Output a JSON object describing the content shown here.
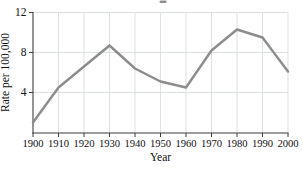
{
  "chart_data": {
    "type": "line",
    "title": "",
    "xlabel": "Year",
    "ylabel": "Rate per 100,000",
    "x": [
      1900,
      1910,
      1920,
      1930,
      1940,
      1950,
      1960,
      1970,
      1980,
      1990,
      2000
    ],
    "values": [
      1.0,
      4.5,
      6.6,
      8.7,
      6.4,
      5.1,
      4.5,
      8.2,
      10.3,
      9.5,
      6.1
    ],
    "xticks": [
      "1900",
      "1910",
      "1920",
      "1930",
      "1940",
      "1950",
      "1960",
      "1970",
      "1980",
      "1990",
      "2000"
    ],
    "yticks": [
      4,
      8,
      12
    ],
    "ylim": [
      0,
      12
    ],
    "xlim": [
      1900,
      2000
    ],
    "grid": true,
    "legend": false,
    "colors": {
      "line": "#8c8c8c",
      "grid": "#dbe1dd",
      "axis": "#3c3c3c",
      "text": "#111111",
      "background": "#ffffff",
      "title_remnant": "#6a6a6a"
    }
  }
}
